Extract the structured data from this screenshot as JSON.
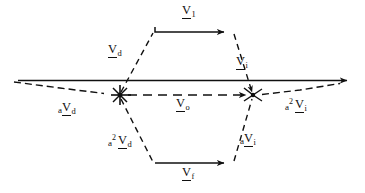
{
  "figure": {
    "ink_color": "#101010",
    "background": "#ffffff",
    "width": 365,
    "height": 193
  },
  "labels": {
    "v1": {
      "prefix": "",
      "superscript": "",
      "symbol": "V",
      "subscript": "1",
      "text": "V1",
      "x": 186,
      "y": 6
    },
    "vd": {
      "prefix": "",
      "superscript": "",
      "symbol": "V",
      "subscript": "d",
      "text": "Vd",
      "x": 111,
      "y": 45
    },
    "vi": {
      "prefix": "",
      "superscript": "",
      "symbol": "V",
      "subscript": "i",
      "text": "Vi",
      "x": 239,
      "y": 57
    },
    "vo": {
      "prefix": "",
      "superscript": "",
      "symbol": "V",
      "subscript": "o",
      "text": "Vo",
      "x": 178,
      "y": 99
    },
    "vf": {
      "prefix": "",
      "superscript": "",
      "symbol": "V",
      "subscript": "f",
      "text": "Vf",
      "x": 186,
      "y": 168
    },
    "avd": {
      "prefix": "a",
      "superscript": "",
      "symbol": "V",
      "subscript": "d",
      "text": "aVd",
      "x": 62,
      "y": 103
    },
    "a2vi": {
      "prefix": "a",
      "superscript": "2",
      "symbol": "V",
      "subscript": "i",
      "text": "a2Vi",
      "x": 289,
      "y": 100
    },
    "a2vd": {
      "prefix": "a",
      "superscript": "2",
      "symbol": "V",
      "subscript": "d",
      "text": "a2Vd",
      "x": 112,
      "y": 136
    },
    "avi": {
      "prefix": "a",
      "superscript": "",
      "symbol": "V",
      "subscript": "i",
      "text": "aVi",
      "x": 243,
      "y": 134
    }
  },
  "geometry": {
    "axis": {
      "x1": 18,
      "y1": 80,
      "x2": 352,
      "y2": 80,
      "style": "solid",
      "arrow_end": true
    },
    "vo_line": {
      "x1": 120,
      "y1": 95,
      "x2": 253,
      "y2": 95,
      "style": "dashed",
      "arrow_end": true
    },
    "node_left": {
      "x": 120,
      "y": 95,
      "type": "starburst"
    },
    "node_right": {
      "x": 253,
      "y": 95,
      "type": "converging-arrows"
    },
    "v1_arrow": {
      "x1": 155,
      "y1": 32,
      "x2": 231,
      "y2": 32,
      "style": "solid",
      "arrow_end": true
    },
    "vf_arrow": {
      "x1": 155,
      "y1": 163,
      "x2": 231,
      "y2": 163,
      "style": "solid",
      "arrow_end": true
    },
    "upper_left_leg": {
      "x1": 120,
      "y1": 95,
      "x2": 155,
      "y2": 32,
      "style": "dashed"
    },
    "upper_right_leg": {
      "x1": 231,
      "y1": 32,
      "x2": 253,
      "y2": 95,
      "style": "dashed"
    },
    "lower_left_leg": {
      "x1": 120,
      "y1": 95,
      "x2": 155,
      "y2": 163,
      "style": "dashed"
    },
    "lower_right_leg": {
      "x1": 231,
      "y1": 163,
      "x2": 253,
      "y2": 95,
      "style": "dashed"
    },
    "left_tail": {
      "x1": 14,
      "y1": 82,
      "x2": 120,
      "y2": 95,
      "style": "dashed"
    },
    "right_tail": {
      "x1": 253,
      "y1": 95,
      "x2": 340,
      "y2": 82,
      "style": "dashed"
    }
  }
}
